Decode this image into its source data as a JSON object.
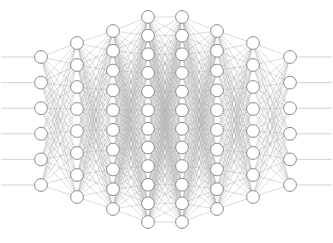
{
  "figure": {
    "caption_fragment": "",
    "background_color": "#ffffff",
    "node_fill_color": "#ffffff",
    "node_stroke_color": "#8c8c8c",
    "edge_color": "#b0b0b0",
    "stub_color": "#c8c8c8",
    "node_radius": 6.4,
    "node_stroke_width": 1.0,
    "edge_stroke_width": 0.45,
    "stub_length": 40
  },
  "chart_data": {
    "type": "diagram",
    "xlabel": "",
    "ylabel": "",
    "grid": false,
    "legend_position": "none",
    "layer_count": 8,
    "total_nodes": 72,
    "connection_style": "fully-connected",
    "layers": [
      {
        "index": 0,
        "name": "input-layer",
        "role": "input",
        "node_count": 6,
        "x": 41,
        "y_top": 57,
        "y_bottom": 185
      },
      {
        "index": 1,
        "name": "hidden-layer-1",
        "role": "hidden",
        "node_count": 8,
        "x": 77,
        "y_top": 43,
        "y_bottom": 197
      },
      {
        "index": 2,
        "name": "hidden-layer-2",
        "role": "hidden",
        "node_count": 10,
        "x": 113,
        "y_top": 31,
        "y_bottom": 209
      },
      {
        "index": 3,
        "name": "hidden-layer-3",
        "role": "hidden",
        "node_count": 12,
        "x": 148,
        "y_top": 17,
        "y_bottom": 222
      },
      {
        "index": 4,
        "name": "hidden-layer-4",
        "role": "hidden",
        "node_count": 12,
        "x": 182,
        "y_top": 17,
        "y_bottom": 222
      },
      {
        "index": 5,
        "name": "hidden-layer-5",
        "role": "hidden",
        "node_count": 10,
        "x": 217,
        "y_top": 31,
        "y_bottom": 209
      },
      {
        "index": 6,
        "name": "hidden-layer-6",
        "role": "hidden",
        "node_count": 8,
        "x": 253,
        "y_top": 43,
        "y_bottom": 197
      },
      {
        "index": 7,
        "name": "output-layer",
        "role": "output",
        "node_count": 6,
        "x": 290,
        "y_top": 57,
        "y_bottom": 185
      }
    ],
    "node_counts_by_layer": [
      6,
      8,
      10,
      12,
      12,
      10,
      8,
      6
    ]
  }
}
